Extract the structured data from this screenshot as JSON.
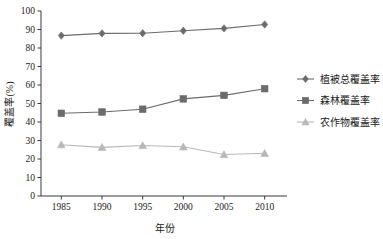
{
  "chart_data": {
    "type": "line",
    "title": "",
    "xlabel": "年份",
    "ylabel": "覆盖率(%)",
    "categories": [
      "1985",
      "1990",
      "1995",
      "2000",
      "2005",
      "2010"
    ],
    "x": [
      1985,
      1990,
      1995,
      2000,
      2005,
      2010
    ],
    "xlim": [
      1982.5,
      2012.5
    ],
    "ylim": [
      0,
      100
    ],
    "ytick_labels": [
      "0",
      "10",
      "20",
      "30",
      "40",
      "50",
      "60",
      "70",
      "80",
      "90",
      "100"
    ],
    "yticks": [
      0,
      10,
      20,
      30,
      40,
      50,
      60,
      70,
      80,
      90,
      100
    ],
    "grid": false,
    "legend_position": "right",
    "series": [
      {
        "name": "植被总覆盖率",
        "marker": "diamond",
        "color": "#6b6b6b",
        "values": [
          86.7,
          87.9,
          88.0,
          89.3,
          90.6,
          92.7
        ]
      },
      {
        "name": "森林覆盖率",
        "marker": "square",
        "color": "#6b6b6b",
        "values": [
          44.7,
          45.4,
          46.9,
          52.5,
          54.4,
          58.0
        ]
      },
      {
        "name": "农作物覆盖率",
        "marker": "triangle",
        "color": "#b8b8b8",
        "values": [
          27.7,
          26.3,
          27.3,
          26.6,
          22.4,
          23.1
        ]
      }
    ]
  },
  "colors": {
    "axis": "#3a3a3a",
    "text": "#1a1a1a",
    "series_dark": "#6b6b6b",
    "series_light": "#b8b8b8",
    "background": "#ffffff"
  }
}
